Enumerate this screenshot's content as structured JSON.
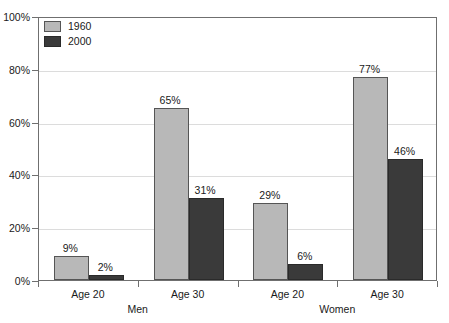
{
  "chart_data": {
    "type": "bar",
    "title": "",
    "xlabel": "",
    "ylabel": "",
    "ylim": [
      0,
      100
    ],
    "ytick_labels": [
      "0%",
      "20%",
      "40%",
      "60%",
      "80%",
      "100%"
    ],
    "ytick_values": [
      0,
      20,
      40,
      60,
      80,
      100
    ],
    "grid": true,
    "legend_position": "top-left",
    "categories": [
      "Age 20",
      "Age 30",
      "Age 20",
      "Age 30"
    ],
    "groups": [
      "Men",
      "Women"
    ],
    "series": [
      {
        "name": "1960",
        "color": "#b8b8b8",
        "values": [
          9,
          65,
          29,
          77
        ]
      },
      {
        "name": "2000",
        "color": "#3a3a3a",
        "values": [
          2,
          31,
          6,
          46
        ]
      }
    ],
    "data_labels": [
      "9%",
      "2%",
      "65%",
      "31%",
      "29%",
      "6%",
      "77%",
      "46%"
    ],
    "value_suffix": "%"
  },
  "legend": {
    "items": [
      {
        "label": "1960"
      },
      {
        "label": "2000"
      }
    ]
  },
  "axis": {
    "y_ticks": [
      {
        "label": "100%",
        "value": 100
      },
      {
        "label": "80%",
        "value": 80
      },
      {
        "label": "60%",
        "value": 60
      },
      {
        "label": "40%",
        "value": 40
      },
      {
        "label": "20%",
        "value": 20
      },
      {
        "label": "0%",
        "value": 0
      }
    ],
    "x_categories": [
      {
        "label": "Age 20"
      },
      {
        "label": "Age 30"
      },
      {
        "label": "Age 20"
      },
      {
        "label": "Age 30"
      }
    ],
    "x_groups": [
      {
        "label": "Men"
      },
      {
        "label": "Women"
      }
    ]
  }
}
